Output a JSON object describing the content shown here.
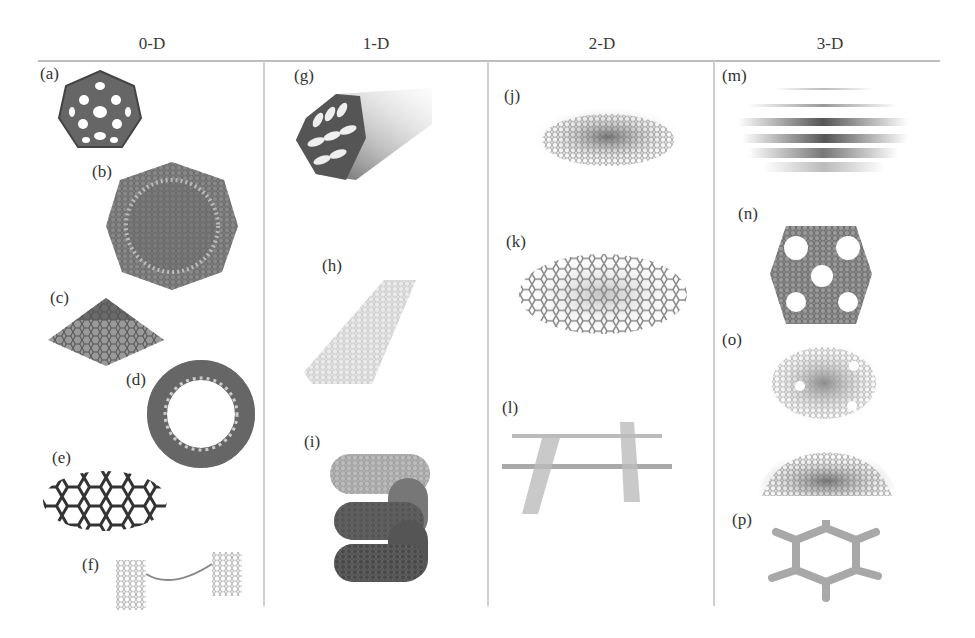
{
  "figure": {
    "columns": [
      {
        "header": "0-D",
        "panels": [
          {
            "label": "(a)",
            "depicts": "fullerene (buckyball)"
          },
          {
            "label": "(b)",
            "depicts": "onion-like carbon sphere"
          },
          {
            "label": "(c)",
            "depicts": "carbon nanocone"
          },
          {
            "label": "(d)",
            "depicts": "carbon nanotorus"
          },
          {
            "label": "(e)",
            "depicts": "graphene quantum dot"
          },
          {
            "label": "(f)",
            "depicts": "nanotube dumbbell"
          }
        ]
      },
      {
        "header": "1-D",
        "panels": [
          {
            "label": "(g)",
            "depicts": "multi-walled nanotube"
          },
          {
            "label": "(h)",
            "depicts": "graphene nanoribbon"
          },
          {
            "label": "(i)",
            "depicts": "helical nanotube"
          }
        ]
      },
      {
        "header": "2-D",
        "panels": [
          {
            "label": "(j)",
            "depicts": "graphene sheet"
          },
          {
            "label": "(k)",
            "depicts": "porous graphene sheet"
          },
          {
            "label": "(l)",
            "depicts": "crossed nanoribbons"
          }
        ]
      },
      {
        "header": "3-D",
        "panels": [
          {
            "label": "(m)",
            "depicts": "stacked graphite layers"
          },
          {
            "label": "(n)",
            "depicts": "porous 3D framework"
          },
          {
            "label": "(o)",
            "depicts": "porous carbon structures"
          },
          {
            "label": "(p)",
            "depicts": "hexagonal 3D network"
          }
        ]
      }
    ]
  },
  "colors": {
    "line": "#bdbdbd",
    "text": "#333333",
    "structure": "#555555"
  }
}
